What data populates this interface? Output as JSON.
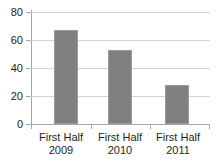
{
  "chart_data": {
    "type": "bar",
    "title": "",
    "xlabel": "",
    "ylabel": "",
    "categories": [
      "First Half 2009",
      "First Half 2010",
      "First Half 2011"
    ],
    "category_lines": [
      {
        "line1": "First Half",
        "line2": "2009"
      },
      {
        "line1": "First Half",
        "line2": "2010"
      },
      {
        "line1": "First Half",
        "line2": "2011"
      }
    ],
    "values": [
      67,
      53,
      28
    ],
    "ylim": [
      0,
      80
    ],
    "yticks": [
      0,
      20,
      40,
      60,
      80
    ],
    "ytick_labels": [
      "0",
      "20",
      "40",
      "60",
      "80"
    ],
    "grid": true,
    "legend": false,
    "bar_color": "#808080",
    "gridline_color": "#d2d2d2",
    "axis_color": "#a6a6a6",
    "text_color": "#231f20"
  }
}
